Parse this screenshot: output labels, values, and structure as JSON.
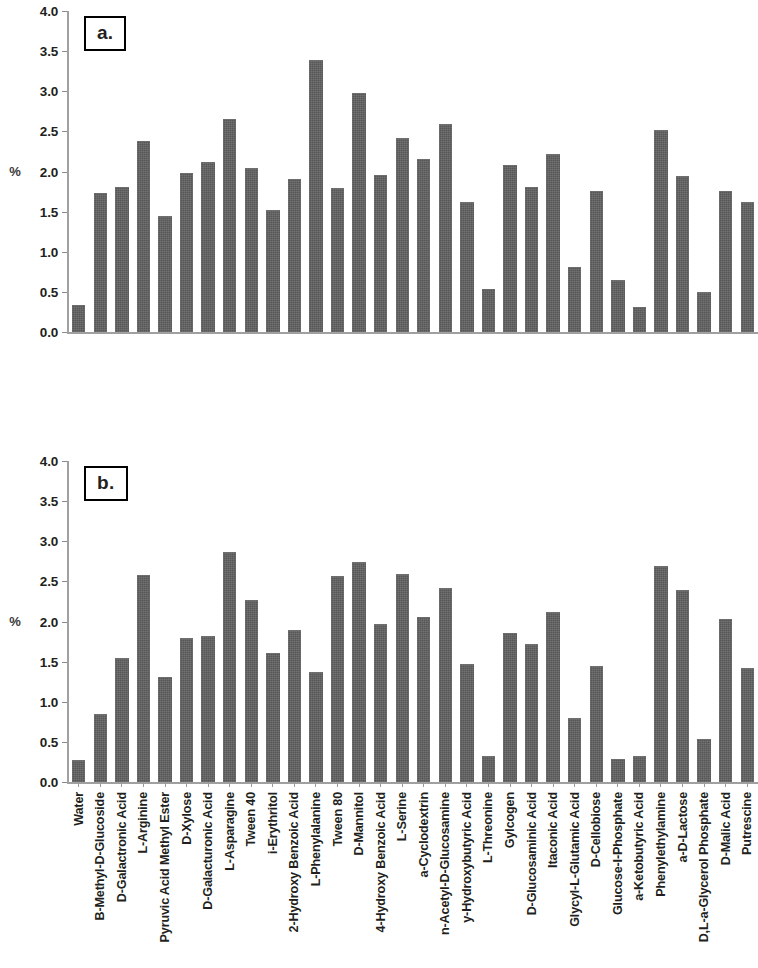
{
  "figure": {
    "panels": [
      {
        "id": "a",
        "letter": "a.",
        "ylabel": "%"
      },
      {
        "id": "b",
        "letter": "b.",
        "ylabel": "%"
      }
    ],
    "y_ticks": [
      "0.0",
      "0.5",
      "1.0",
      "1.5",
      "2.0",
      "2.5",
      "3.0",
      "3.5",
      "4.0"
    ],
    "bar_color": "#616161",
    "axis_color": "#a0a0a0"
  },
  "chart_data": [
    {
      "type": "bar",
      "title": "a.",
      "xlabel": "",
      "ylabel": "%",
      "ylim": [
        0,
        4
      ],
      "yticks": [
        0,
        0.5,
        1,
        1.5,
        2,
        2.5,
        3,
        3.5,
        4
      ],
      "grid": false,
      "legend": null,
      "categories": [
        "Water",
        "B-Methyl-D-Glucoside",
        "D-Galactronic Acid",
        "L-Arginine",
        "Pyruvic Acid Methyl Ester",
        "D-Xylose",
        "D-Galacturonic Acid",
        "L-Asparagine",
        "Tween 40",
        "i-Erythritol",
        "2-Hydroxy Benzoic Acid",
        "L-Phenylalanine",
        "Tween 80",
        "D-Mannitol",
        "4-Hydroxy Benzoic Acid",
        "L-Serine",
        "a-Cyclodextrin",
        "n-Acetyl-D-Glucosamine",
        "y-Hydroxybutyric Acid",
        "L-Threonine",
        "Gylcogen",
        "D-Glucosaminic Acid",
        "Itaconic Acid",
        "Glycyl-L-Glutamic Acid",
        "D-Cellobiose",
        "Glucose-I-Phosphate",
        "a-Ketobutyric Acid",
        "Phenylethylamine",
        "a-D-Lactose",
        "D,L-a-Glycerol Phosphate",
        "D-Malic Acid",
        "Putrescine"
      ],
      "values": [
        0.33,
        1.72,
        1.79,
        2.37,
        1.43,
        1.97,
        2.11,
        2.64,
        2.03,
        1.51,
        1.9,
        3.38,
        1.78,
        2.96,
        1.94,
        2.41,
        2.14,
        2.58,
        1.61,
        0.52,
        2.07,
        1.8,
        2.21,
        0.8,
        1.75,
        0.64,
        0.3,
        2.5,
        1.93,
        0.48,
        1.75,
        1.61
      ]
    },
    {
      "type": "bar",
      "title": "b.",
      "xlabel": "",
      "ylabel": "%",
      "ylim": [
        0,
        4
      ],
      "yticks": [
        0,
        0.5,
        1,
        1.5,
        2,
        2.5,
        3,
        3.5,
        4
      ],
      "grid": false,
      "legend": null,
      "categories": [
        "Water",
        "B-Methyl-D-Glucoside",
        "D-Galactronic Acid",
        "L-Arginine",
        "Pyruvic Acid Methyl Ester",
        "D-Xylose",
        "D-Galacturonic Acid",
        "L-Asparagine",
        "Tween 40",
        "i-Erythritol",
        "2-Hydroxy Benzoic Acid",
        "L-Phenylalanine",
        "Tween 80",
        "D-Mannitol",
        "4-Hydroxy Benzoic Acid",
        "L-Serine",
        "a-Cyclodextrin",
        "n-Acetyl-D-Glucosamine",
        "y-Hydroxybutyric Acid",
        "L-Threonine",
        "Gylcogen",
        "D-Glucosaminic Acid",
        "Itaconic Acid",
        "Glycyl-L-Glutamic Acid",
        "D-Cellobiose",
        "Glucose-I-Phosphate",
        "a-Ketobutyric Acid",
        "Phenylethylamine",
        "a-D-Lactose",
        "D,L-a-Glycerol Phosphate",
        "D-Malic Acid",
        "Putrescine"
      ],
      "values": [
        0.26,
        0.83,
        1.53,
        2.57,
        1.29,
        1.78,
        1.81,
        2.85,
        2.26,
        1.6,
        1.88,
        1.36,
        2.56,
        2.73,
        1.96,
        2.58,
        2.04,
        2.4,
        1.46,
        0.31,
        1.85,
        1.71,
        2.11,
        0.78,
        1.43,
        0.28,
        0.31,
        2.68,
        2.38,
        0.52,
        2.02,
        1.41
      ]
    }
  ]
}
